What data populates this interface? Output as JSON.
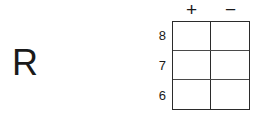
{
  "figure": {
    "background_color": "#ffffff",
    "line_color": "#2b2b2b",
    "text_color": "#1a1a1a"
  },
  "row_variable": {
    "label": "R"
  },
  "table": {
    "column_headers": [
      "+",
      "−"
    ],
    "row_headers": [
      "8",
      "7",
      "6"
    ],
    "cells": [
      [
        "",
        ""
      ],
      [
        "",
        ""
      ],
      [
        "",
        ""
      ]
    ]
  }
}
